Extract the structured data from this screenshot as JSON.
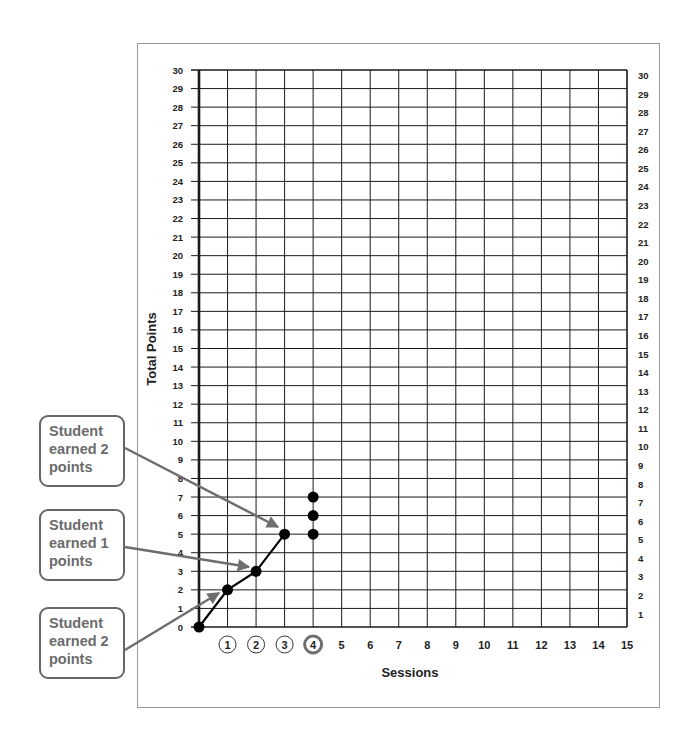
{
  "chart_data": {
    "type": "line",
    "title": "",
    "xlabel": "Sessions",
    "ylabel": "Total Points",
    "xlim": [
      0,
      15
    ],
    "ylim": [
      0,
      30
    ],
    "grid": true,
    "x_ticks": [
      1,
      2,
      3,
      4,
      5,
      6,
      7,
      8,
      9,
      10,
      11,
      12,
      13,
      14,
      15
    ],
    "y_ticks": [
      0,
      1,
      2,
      3,
      4,
      5,
      6,
      7,
      8,
      9,
      10,
      11,
      12,
      13,
      14,
      15,
      16,
      17,
      18,
      19,
      20,
      21,
      22,
      23,
      24,
      25,
      26,
      27,
      28,
      29,
      30
    ],
    "right_y_ticks": [
      1,
      2,
      3,
      4,
      5,
      6,
      7,
      8,
      9,
      10,
      11,
      12,
      13,
      14,
      15,
      16,
      17,
      18,
      19,
      20,
      21,
      22,
      23,
      24,
      25,
      26,
      27,
      28,
      29,
      30
    ],
    "circled_x_ticks": [
      1,
      2,
      3
    ],
    "highlighted_x_tick": 4,
    "series": [
      {
        "name": "Cumulative points",
        "x": [
          0,
          1,
          2,
          3
        ],
        "values": [
          0,
          2,
          3,
          5
        ],
        "connected": true
      }
    ],
    "extra_points": [
      {
        "x": 4,
        "y": 5
      },
      {
        "x": 4,
        "y": 6
      },
      {
        "x": 4,
        "y": 7
      }
    ],
    "annotations": [
      {
        "text": "Student\nearned 2\npoints",
        "target": {
          "x": 3,
          "y": 5
        }
      },
      {
        "text": "Student\nearned 1\npoints",
        "target": {
          "x": 2,
          "y": 3
        }
      },
      {
        "text": "Student\nearned 2\npoints",
        "target": {
          "x": 1,
          "y": 2
        }
      }
    ]
  },
  "callouts": [
    {
      "label": "Student\nearned 2\npoints"
    },
    {
      "label": "Student\nearned 1\npoints"
    },
    {
      "label": "Student\nearned 2\npoints"
    }
  ],
  "colors": {
    "grid": "#1a1a1a",
    "axis": "#000000",
    "arrow": "#6e6e6e",
    "callout_text": "#6b6b6b",
    "highlight_ring": "#6e6e6e"
  }
}
